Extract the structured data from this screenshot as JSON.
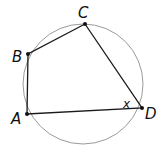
{
  "diagram": {
    "type": "cyclic-quadrilateral",
    "circle": {
      "cx": 83,
      "cy": 84,
      "r": 60,
      "stroke": "#9a9a9a"
    },
    "points": [
      {
        "label": "A",
        "x": 27,
        "y": 114,
        "lx": 11,
        "ly": 124
      },
      {
        "label": "B",
        "x": 28,
        "y": 54,
        "lx": 12,
        "ly": 62
      },
      {
        "label": "C",
        "x": 85,
        "y": 24,
        "lx": 78,
        "ly": 18
      },
      {
        "label": "D",
        "x": 142,
        "y": 108,
        "lx": 145,
        "ly": 119
      }
    ],
    "angle_label": {
      "text": "x",
      "x": 123,
      "y": 108
    },
    "edge_color": "#1a1a1a"
  }
}
